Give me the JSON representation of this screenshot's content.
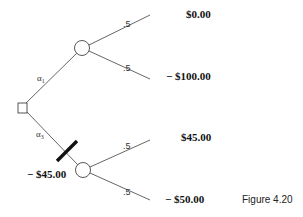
{
  "figure": {
    "caption": "Figure 4.20",
    "decision_node": {
      "type": "decision",
      "shape": "square"
    },
    "alternatives": [
      {
        "label": "α",
        "subscript": "1",
        "cost": null,
        "blocked": false,
        "chance_node": {
          "outcomes": [
            {
              "probability": ".5",
              "payoff": "$0.00"
            },
            {
              "probability": ".5",
              "payoff": "− $100.00"
            }
          ]
        }
      },
      {
        "label": "α",
        "subscript": "3",
        "cost": "− $45.00",
        "blocked": true,
        "chance_node": {
          "outcomes": [
            {
              "probability": ".5",
              "payoff": "$45.00"
            },
            {
              "probability": ".5",
              "payoff": "− $50.00"
            }
          ]
        }
      }
    ]
  },
  "colors": {
    "line": "#555555",
    "text": "#111111",
    "background": "#ffffff"
  }
}
